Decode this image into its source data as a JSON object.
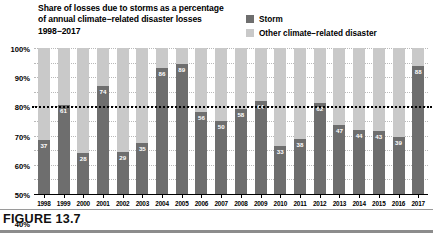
{
  "figure": {
    "caption": "FIGURE 13.7",
    "title_lines": [
      "Share of losses due to storms as a percentage",
      "of annual climate−related disaster losses",
      "1998−2017"
    ]
  },
  "legend": {
    "items": [
      {
        "label": "Storm",
        "color": "#6e6e6e"
      },
      {
        "label": "Other climate−related disaster",
        "color": "#c9c9c9"
      }
    ]
  },
  "colors": {
    "storm": "#6e6e6e",
    "other": "#c9c9c9",
    "grid": "#b9b9b9",
    "reference_line": "#000000",
    "axis": "#000000",
    "value_label": "#ffffff"
  },
  "chart_data": {
    "type": "bar",
    "title": "Share of losses due to storms as a percentage of annual climate−related disaster losses 1998−2017",
    "subtitle": "",
    "xlabel": "",
    "ylabel": "",
    "ylim": [
      0,
      100
    ],
    "ytick_labels": [
      "0%",
      "10%",
      "20%",
      "30%",
      "40%",
      "50%",
      "60%",
      "70%",
      "80%",
      "90%",
      "100%"
    ],
    "ytick_values": [
      0,
      10,
      20,
      30,
      40,
      50,
      60,
      70,
      80,
      90,
      100
    ],
    "grid": true,
    "legend_position": "top-right",
    "stacked": true,
    "annotations": [
      {
        "type": "horizontal-reference-line",
        "value": 60,
        "style": "dotted",
        "label": ""
      }
    ],
    "categories": [
      "1998",
      "1999",
      "2000",
      "2001",
      "2002",
      "2003",
      "2004",
      "2005",
      "2006",
      "2007",
      "2008",
      "2009",
      "2010",
      "2011",
      "2012",
      "2013",
      "2014",
      "2015",
      "2016",
      "2017"
    ],
    "series": [
      {
        "name": "Storm",
        "color": "#6e6e6e",
        "values": [
          37,
          61,
          28,
          74,
          29,
          35,
          86,
          89,
          56,
          50,
          58,
          64,
          33,
          38,
          62,
          47,
          44,
          43,
          39,
          88
        ]
      },
      {
        "name": "Other climate−related disaster",
        "color": "#c9c9c9",
        "values": [
          63,
          39,
          72,
          26,
          71,
          65,
          14,
          11,
          44,
          50,
          42,
          36,
          67,
          62,
          38,
          53,
          56,
          57,
          61,
          12
        ]
      }
    ],
    "data_labels": [
      37,
      61,
      28,
      74,
      29,
      35,
      86,
      89,
      56,
      50,
      58,
      64,
      33,
      38,
      62,
      47,
      44,
      43,
      39,
      88
    ]
  }
}
